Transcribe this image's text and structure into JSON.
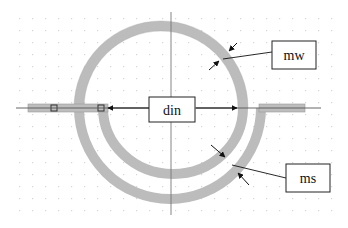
{
  "diagram": {
    "type": "spiral inductor layout",
    "labels": {
      "inner_diameter": "din",
      "metal_width": "mw",
      "metal_spacing": "ms"
    },
    "colors": {
      "trace": "#b9b9b9",
      "trace_edge": "#a8a8a8",
      "axis": "#555555",
      "arrow": "#111111",
      "grid_dot": "#d8d8d8",
      "label_border": "#222222"
    }
  }
}
